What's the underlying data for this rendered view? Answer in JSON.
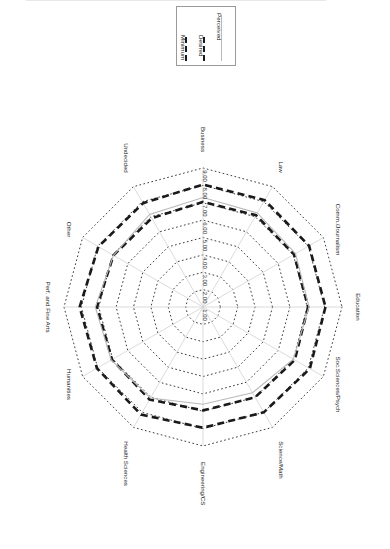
{
  "chart_data": {
    "type": "radar",
    "title": "",
    "rotation_note": "entire figure rendered rotated 90 degrees clockwise; labels read bottom-to-top",
    "grid": true,
    "legend_position": "top-center",
    "radial_axis": {
      "min": 1.0,
      "max": 9.0,
      "step": 1.0,
      "tick_labels": [
        "1.00",
        "2.00",
        "3.00",
        "4.00",
        "5.00",
        "6.00",
        "7.00",
        "8.00",
        "9.00"
      ],
      "tick_label_axis": "Business"
    },
    "categories": [
      "Education",
      "Soc.Sciences/Psych",
      "Science/Math",
      "Engineering/CS",
      "Health Sciences",
      "Humanities",
      "Perf. and Fine Arts",
      "Other",
      "Undecided",
      "Business",
      "Law",
      "Comm./Journalism"
    ],
    "series": [
      {
        "name": "Minimum",
        "style": "bold-dashed",
        "color": "#1a1a1a",
        "values": [
          7.05,
          7.1,
          7.0,
          6.95,
          7.15,
          7.05,
          7.1,
          6.95,
          6.9,
          7.05,
          7.1,
          7.05
        ]
      },
      {
        "name": "Desired",
        "style": "bold-dashed",
        "color": "#1a1a1a",
        "values": [
          8.05,
          8.1,
          8.0,
          7.95,
          8.15,
          8.05,
          8.1,
          7.95,
          7.9,
          8.05,
          8.1,
          8.05
        ]
      },
      {
        "name": "Perceived",
        "style": "thin-solid",
        "color": "#b9b9b9",
        "values": [
          7.1,
          7.0,
          6.7,
          6.6,
          7.05,
          7.1,
          7.2,
          6.95,
          7.15,
          7.3,
          7.25,
          7.15
        ]
      }
    ]
  },
  "legend": {
    "items": [
      {
        "label": "Minimum",
        "icon": "bold-dashed-line-swatch"
      },
      {
        "label": "Desired",
        "icon": "bold-dashed-line-swatch"
      },
      {
        "label": "Perceived",
        "icon": "thin-gray-line-swatch"
      }
    ]
  }
}
